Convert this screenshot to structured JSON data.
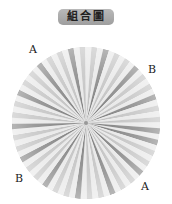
{
  "title": "組合圖",
  "labels": [
    {
      "text": "A",
      "x": 29,
      "y": 44
    },
    {
      "text": "B",
      "x": 148,
      "y": 64
    },
    {
      "text": "B",
      "x": 15,
      "y": 173
    },
    {
      "text": "A",
      "x": 141,
      "y": 181
    }
  ],
  "rosette": {
    "center_x": 86,
    "center_y": 123,
    "radius_x": 74,
    "radius_y": 76,
    "pleat_count": 40,
    "colors": {
      "light": "#e6e6e6",
      "mid": "#bdbdbd",
      "dark": "#7a7a7a"
    }
  }
}
